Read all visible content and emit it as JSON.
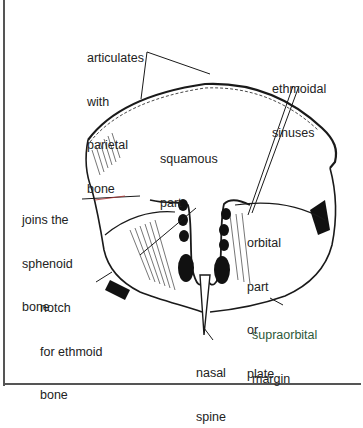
{
  "figure": {
    "colors": {
      "line": "#1a1a1a",
      "label": "#222222",
      "label_green": "#2d5a3a",
      "frame": "#555555",
      "pointer_red": "#b03030"
    }
  },
  "labels": {
    "articulates": [
      "articulates",
      "with",
      "parietal",
      "bone"
    ],
    "ethmoidal": [
      "ethmoidal",
      "sinuses"
    ],
    "squamous": [
      "squamous",
      "part"
    ],
    "sphenoid": [
      "joins the",
      "sphenoid",
      "bone"
    ],
    "orbital": [
      "orbital",
      "part",
      "or",
      "plate"
    ],
    "notch": [
      "notch",
      "for ethmoid",
      "bone"
    ],
    "supraorbital": [
      "supraorbital",
      "margin"
    ],
    "nasal": [
      "nasal",
      "spine"
    ]
  }
}
